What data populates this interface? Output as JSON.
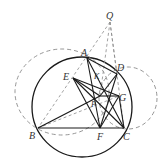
{
  "figure": {
    "colors": {
      "solid": "#1a1a1a",
      "dashed": "#8a8a8a",
      "label": "#333333",
      "background": "#ffffff"
    },
    "points": {
      "Q": {
        "label": "Q",
        "x": 110,
        "y": 22
      },
      "A": {
        "label": "A",
        "x": 87,
        "y": 58
      },
      "D": {
        "label": "D",
        "x": 117,
        "y": 74
      },
      "E": {
        "label": "E",
        "x": 73,
        "y": 78
      },
      "K": {
        "label": "K",
        "x": 96,
        "y": 79
      },
      "P": {
        "label": "P",
        "x": 100,
        "y": 96
      },
      "G": {
        "label": "G",
        "x": 119,
        "y": 96
      },
      "B": {
        "label": "B",
        "x": 38,
        "y": 128
      },
      "F": {
        "label": "F",
        "x": 100,
        "y": 128
      },
      "C": {
        "label": "C",
        "x": 124,
        "y": 128
      }
    },
    "circles": [
      {
        "name": "main-circle",
        "style": "solid",
        "cx": 82,
        "cy": 107,
        "r": 50
      },
      {
        "name": "left-dashed-circle",
        "style": "dashed",
        "cx": 62,
        "cy": 92,
        "rx": 47,
        "ry": 43
      },
      {
        "name": "right-dashed-circle",
        "style": "dashed",
        "cx": 128,
        "cy": 98,
        "rx": 29,
        "ry": 31
      }
    ],
    "solid_segments": [
      [
        "B",
        "C"
      ],
      [
        "A",
        "D"
      ],
      [
        "A",
        "C"
      ],
      [
        "B",
        "P"
      ],
      [
        "E",
        "F"
      ],
      [
        "E",
        "G"
      ],
      [
        "E",
        "C"
      ],
      [
        "A",
        "F"
      ],
      [
        "D",
        "B"
      ],
      [
        "D",
        "F"
      ],
      [
        "F",
        "G"
      ],
      [
        "P",
        "G"
      ]
    ],
    "dashed_segments": [
      [
        "Q",
        "B"
      ],
      [
        "Q",
        "C"
      ],
      [
        "Q",
        "P"
      ],
      [
        "Q",
        "A"
      ],
      [
        "Q",
        "D"
      ]
    ]
  }
}
